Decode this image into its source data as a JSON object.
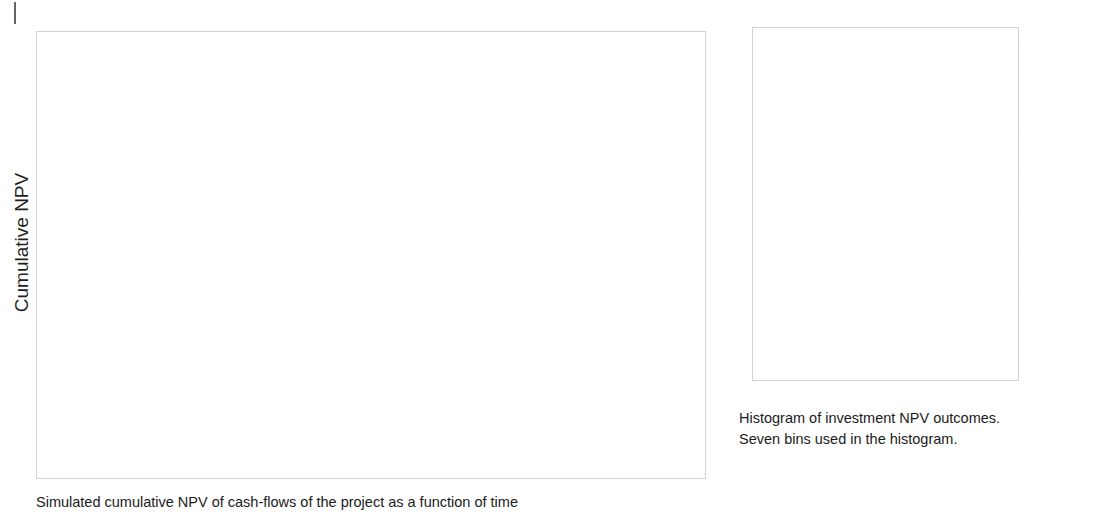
{
  "page": {
    "background_color": "#ffffff",
    "ink_color": "#1b1b1b",
    "corner_tick": "|"
  },
  "spaghetti_panel": {
    "caption": "Simulated cumulative NPV of cash-flows of the project as a function of time",
    "frame_color": "#d2d2d2"
  },
  "histogram_panel": {
    "caption": "Histogram of investment NPV outcomes.\nSeven bins used in the histogram.",
    "frame_color": "#d2d2d2"
  },
  "chart_data": [
    {
      "id": "cumulative-npv-spaghetti",
      "type": "line",
      "title": "",
      "subtitle": "",
      "xlabel": "",
      "ylabel": "Cumulative NPV",
      "xlim": [
        0,
        8
      ],
      "ylim": [
        -1200,
        600
      ],
      "xticks": [
        0,
        1,
        2,
        3,
        4,
        5,
        6,
        7,
        8
      ],
      "xticklabels": [
        "0",
        "1",
        "2",
        "3",
        "4",
        "5",
        "6",
        "7",
        "8"
      ],
      "yticks": [
        600,
        400,
        200,
        0,
        -200,
        -400,
        -600,
        -800,
        -1000,
        -1200
      ],
      "yticklabels": [
        "600",
        "400",
        "200",
        "0",
        "−200",
        "−400",
        "−600",
        "−800",
        "−1000",
        "−1200"
      ],
      "grid": true,
      "legend": "none",
      "annotations": [],
      "series_description": "Monte-Carlo simulation: 100 cumulative-NPV sample paths all starting at -940 at time 0 and fanning out to a final spread of roughly -70 to +445 at time 8.",
      "start_value": -940,
      "n_paths": 100,
      "final_value_range": [
        -70,
        445
      ],
      "line_color": "#6e6e6e",
      "line_opacity": 0.55,
      "line_width": 1.1,
      "series": [
        {
          "name": "path-01",
          "x": [
            0,
            1,
            2,
            3,
            4,
            5,
            6,
            7,
            8
          ],
          "values": [
            -940,
            -805,
            -660,
            -520,
            -370,
            -215,
            -55,
            105,
            262
          ]
        },
        {
          "name": "path-02",
          "x": [
            0,
            1,
            2,
            3,
            4,
            5,
            6,
            7,
            8
          ],
          "values": [
            -940,
            -840,
            -735,
            -625,
            -500,
            -380,
            -250,
            -120,
            15
          ]
        },
        {
          "name": "path-03",
          "x": [
            0,
            1,
            2,
            3,
            4,
            5,
            6,
            7,
            8
          ],
          "values": [
            -940,
            -790,
            -640,
            -480,
            -320,
            -160,
            5,
            175,
            355
          ]
        },
        {
          "name": "path-04",
          "x": [
            0,
            1,
            2,
            3,
            4,
            5,
            6,
            7,
            8
          ],
          "values": [
            -940,
            -825,
            -700,
            -585,
            -455,
            -325,
            -195,
            -60,
            80
          ]
        },
        {
          "name": "path-05",
          "x": [
            0,
            1,
            2,
            3,
            4,
            5,
            6,
            7,
            8
          ],
          "values": [
            -940,
            -775,
            -610,
            -445,
            -275,
            -105,
            70,
            250,
            430
          ]
        },
        {
          "name": "path-06",
          "x": [
            0,
            1,
            2,
            3,
            4,
            5,
            6,
            7,
            8
          ],
          "values": [
            -940,
            -850,
            -760,
            -665,
            -560,
            -455,
            -345,
            -230,
            -110
          ]
        },
        {
          "name": "path-07",
          "x": [
            0,
            1,
            2,
            3,
            4,
            5,
            6,
            7,
            8
          ],
          "values": [
            -940,
            -812,
            -688,
            -560,
            -425,
            -292,
            -152,
            -10,
            135
          ]
        },
        {
          "name": "path-08",
          "x": [
            0,
            1,
            2,
            3,
            4,
            5,
            6,
            7,
            8
          ],
          "values": [
            -940,
            -795,
            -655,
            -505,
            -352,
            -195,
            -35,
            130,
            300
          ]
        },
        {
          "name": "path-09",
          "x": [
            0,
            1,
            2,
            3,
            4,
            5,
            6,
            7,
            8
          ],
          "values": [
            -940,
            -835,
            -722,
            -605,
            -482,
            -360,
            -232,
            -98,
            40
          ]
        },
        {
          "name": "path-10",
          "x": [
            0,
            1,
            2,
            3,
            4,
            5,
            6,
            7,
            8
          ],
          "values": [
            -940,
            -782,
            -625,
            -465,
            -300,
            -135,
            38,
            212,
            392
          ]
        }
      ]
    },
    {
      "id": "npv-outcome-histogram",
      "type": "bar",
      "title": "",
      "xlabel": "",
      "ylabel": "",
      "categories": [
        "[−93, −3]",
        "[−3, 87]",
        "[87, 177]",
        "[177, 267]",
        "[267, 357]",
        "[357, 447]"
      ],
      "values": [
        6,
        8,
        27,
        25,
        24,
        10.2
      ],
      "ylim": [
        0,
        30
      ],
      "yticks": [
        0,
        5,
        10,
        15,
        20,
        25,
        30
      ],
      "yticklabels": [
        "0",
        "5",
        "10",
        "15",
        "20",
        "25",
        "30"
      ],
      "grid": true,
      "legend": "none",
      "bar_color": "#808080",
      "bar_edge_color": "#ffffff",
      "bin_label_rotation": -37,
      "n_bins_stated": 7
    }
  ]
}
